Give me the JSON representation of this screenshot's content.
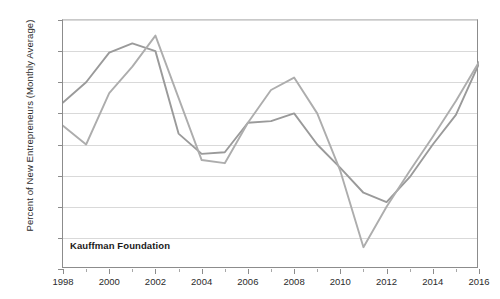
{
  "chart": {
    "ylabel": "Percent of New Entrepreneurs (Monthly Average)",
    "watermark": "Kauffman Foundation"
  },
  "chart_data": {
    "type": "line",
    "title": "",
    "xlabel": "",
    "ylabel": "Percent of New Entrepreneurs (Monthly Average)",
    "xlim": [
      1998,
      2016
    ],
    "ylim": [
      70,
      86
    ],
    "ytick_labels": [
      "86%",
      "84%",
      "82%",
      "80%",
      "78%",
      "76%",
      "74%",
      "72%",
      "70%"
    ],
    "ytick_values": [
      86,
      84,
      82,
      80,
      78,
      76,
      74,
      72,
      70
    ],
    "xtick_labels": [
      "1998",
      "2000",
      "2002",
      "2004",
      "2006",
      "2008",
      "2010",
      "2012",
      "2014",
      "2016"
    ],
    "xtick_values": [
      1998,
      2000,
      2002,
      2004,
      2006,
      2008,
      2010,
      2012,
      2014,
      2016
    ],
    "x": [
      1998,
      1999,
      2000,
      2001,
      2002,
      2003,
      2004,
      2005,
      2006,
      2007,
      2008,
      2009,
      2010,
      2011,
      2012,
      2013,
      2014,
      2015,
      2016
    ],
    "grid": true,
    "legend": "none",
    "annotations": [
      "Kauffman Foundation"
    ],
    "series": [
      {
        "name": "Series 1",
        "color": "#9a9a9a",
        "values": [
          80.7,
          82.0,
          83.9,
          84.5,
          84.0,
          78.7,
          77.4,
          77.5,
          79.4,
          79.5,
          80.0,
          78.0,
          76.5,
          74.9,
          74.3,
          75.9,
          78.0,
          79.9,
          83.2
        ]
      },
      {
        "name": "Series 2",
        "color": "#adadad",
        "values": [
          79.2,
          78.0,
          81.3,
          83.0,
          85.0,
          81.0,
          77.0,
          76.8,
          79.4,
          81.5,
          82.3,
          80.0,
          76.3,
          71.4,
          74.0,
          76.3,
          78.5,
          80.8,
          83.3
        ]
      }
    ]
  }
}
